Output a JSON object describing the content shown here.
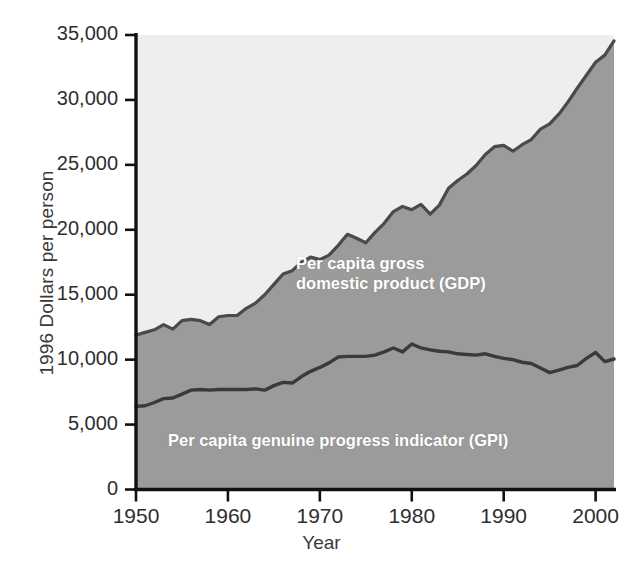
{
  "chart_data": {
    "type": "area",
    "title": "",
    "xlabel": "Year",
    "ylabel": "1996 Dollars per person",
    "xlim": [
      1950,
      2002
    ],
    "ylim": [
      0,
      35000
    ],
    "grid": false,
    "legend_position": "inline-annotations",
    "x_ticks": [
      "1950",
      "1960",
      "1970",
      "1980",
      "1990",
      "2000"
    ],
    "x_tick_values": [
      1950,
      1960,
      1970,
      1980,
      1990,
      2000
    ],
    "y_ticks": [
      "0",
      "5,000",
      "10,000",
      "15,000",
      "20,000",
      "25,000",
      "30,000",
      "35,000"
    ],
    "y_tick_values": [
      0,
      5000,
      10000,
      15000,
      20000,
      25000,
      30000,
      35000
    ],
    "x": [
      1950,
      1951,
      1952,
      1953,
      1954,
      1955,
      1956,
      1957,
      1958,
      1959,
      1960,
      1961,
      1962,
      1963,
      1964,
      1965,
      1966,
      1967,
      1968,
      1969,
      1970,
      1971,
      1972,
      1973,
      1974,
      1975,
      1976,
      1977,
      1978,
      1979,
      1980,
      1981,
      1982,
      1983,
      1984,
      1985,
      1986,
      1987,
      1988,
      1989,
      1990,
      1991,
      1992,
      1993,
      1994,
      1995,
      1996,
      1997,
      1998,
      1999,
      2000,
      2001,
      2002
    ],
    "series": [
      {
        "name": "Per capita gross domestic product (GDP)",
        "label": "Per capita gross\ndomestic product (GDP)",
        "color": "#efeeec",
        "line_color": "#4a4a4a",
        "values": [
          11900,
          12100,
          12300,
          12700,
          12350,
          13000,
          13100,
          13000,
          12700,
          13300,
          13400,
          13400,
          13950,
          14350,
          15000,
          15800,
          16600,
          16850,
          17500,
          17900,
          17700,
          18050,
          18800,
          19650,
          19350,
          19000,
          19800,
          20500,
          21400,
          21800,
          21550,
          21950,
          21200,
          21900,
          23200,
          23800,
          24300,
          24950,
          25800,
          26400,
          26500,
          26050,
          26550,
          26950,
          27750,
          28150,
          28900,
          29850,
          30900,
          31900,
          32900,
          33450,
          34550
        ]
      },
      {
        "name": "Per capita genuine progress indicator (GPI)",
        "label": "Per capita genuine progress indicator (GPI)",
        "color": "#9b9b9b",
        "line_color": "#3a3a3a",
        "values": [
          6400,
          6450,
          6700,
          7000,
          7050,
          7350,
          7650,
          7700,
          7650,
          7700,
          7700,
          7700,
          7700,
          7750,
          7650,
          8000,
          8250,
          8200,
          8700,
          9100,
          9400,
          9750,
          10200,
          10250,
          10250,
          10250,
          10350,
          10600,
          10900,
          10600,
          11200,
          10900,
          10750,
          10650,
          10600,
          10450,
          10400,
          10350,
          10450,
          10250,
          10100,
          10000,
          9800,
          9700,
          9350,
          9000,
          9200,
          9400,
          9550,
          10100,
          10550,
          9850,
          10050
        ]
      }
    ],
    "annotations": [
      {
        "text": "Per capita gross\ndomestic product (GDP)",
        "area": "upper-shaded"
      },
      {
        "text": "Per capita genuine progress indicator (GPI)",
        "area": "lower-shaded"
      }
    ],
    "colors": {
      "gdp_fill": "#efeeec",
      "gpi_fill": "#9b9b9b",
      "line": "#3d3d3d",
      "axis": "#111111",
      "tick_text": "#2e2e2e",
      "annotation_text": "#ffffff"
    }
  }
}
